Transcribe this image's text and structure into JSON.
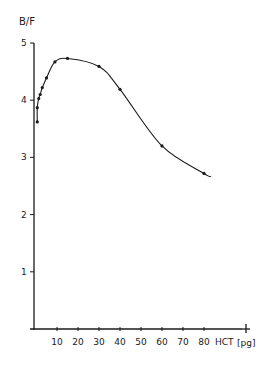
{
  "chart_data": {
    "type": "line",
    "title": "",
    "xlabel": "HCT [pg]",
    "ylabel": "B/F",
    "xlim": [
      0,
      90
    ],
    "ylim": [
      0,
      5
    ],
    "grid": false,
    "legend": null,
    "x_ticks": [
      10,
      20,
      30,
      40,
      50,
      60,
      70,
      80
    ],
    "x_tick_labels": [
      "10",
      "20",
      "30",
      "40",
      "50",
      "60",
      "70",
      "80"
    ],
    "y_ticks": [
      1,
      2,
      3,
      4,
      5
    ],
    "y_tick_labels": [
      "1",
      "2",
      "3",
      "4",
      "5"
    ],
    "series": [
      {
        "name": "B/F vs HCT",
        "marker": "dot",
        "x": [
          0.6,
          0.6,
          1.3,
          2,
          3,
          5,
          9,
          15,
          30,
          40,
          60,
          80
        ],
        "y": [
          3.62,
          3.87,
          4.03,
          4.1,
          4.22,
          4.39,
          4.67,
          4.73,
          4.59,
          4.19,
          3.2,
          2.72
        ]
      }
    ]
  },
  "axes": {
    "y_label": "B/F",
    "x_label_text": "HCT",
    "x_unit": "[pg]",
    "x_end_mark": "+"
  }
}
